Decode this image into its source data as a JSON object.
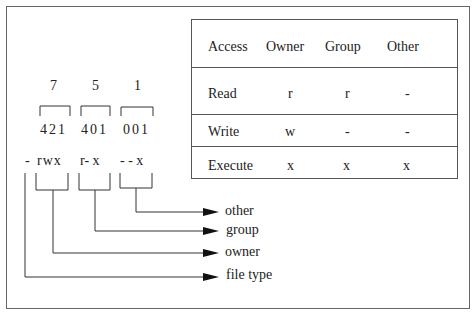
{
  "octal": {
    "digits": [
      "7",
      "5",
      "1"
    ]
  },
  "bits": {
    "groups": [
      "421",
      "401",
      "001"
    ]
  },
  "perm_string": {
    "type": "-",
    "owner": "rwx",
    "group": "r- x",
    "other": "- - x"
  },
  "labels": {
    "other": "other",
    "group": "group",
    "owner": "owner",
    "file_type": "file type"
  },
  "table": {
    "headers": [
      "Access",
      "Owner",
      "Group",
      "Other"
    ],
    "rows": [
      [
        "Read",
        "r",
        "r",
        "-"
      ],
      [
        "Write",
        "w",
        "-",
        "-"
      ],
      [
        "Execute",
        "x",
        "x",
        "x"
      ]
    ]
  }
}
